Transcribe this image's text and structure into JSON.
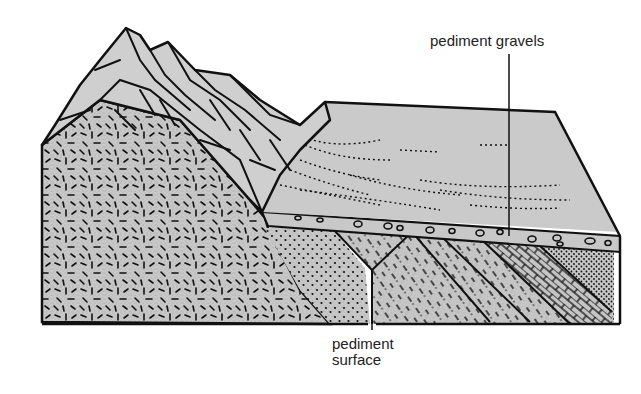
{
  "diagram": {
    "type": "geological block diagram",
    "labels": {
      "pediment_gravels": "pediment gravels",
      "pediment_surface_line1": "pediment",
      "pediment_surface_line2": "surface"
    },
    "colors": {
      "fill": "#c8c8c8",
      "ink": "#111111",
      "background": "#ffffff",
      "text": "#222222"
    }
  }
}
